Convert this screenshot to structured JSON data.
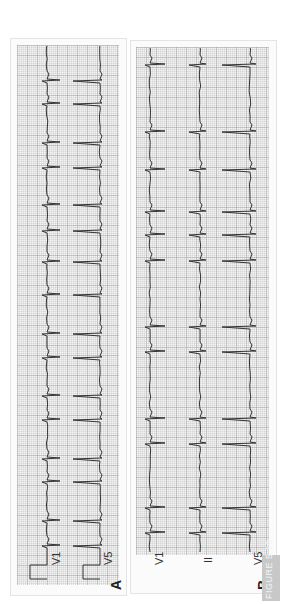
{
  "figure_label": "FIGURE 5.10",
  "panels": [
    {
      "letter": "A",
      "leads": [
        "V1",
        "V5"
      ]
    },
    {
      "letter": "B",
      "leads": [
        "V1",
        "II",
        "V5"
      ]
    }
  ],
  "colors": {
    "trace": "#333333",
    "grid_major": "#b0b0b0",
    "grid_minor": "#d8d8d8",
    "paper": "#f4f4f4",
    "label_box": "#c8c8c8"
  },
  "chart_data": [
    {
      "type": "line",
      "title": "A",
      "orientation": "rotated 90° counter-clockwise (time runs bottom→top)",
      "series": [
        {
          "name": "V1",
          "beat_positions_px": [
            80,
            103,
            142,
            167,
            204,
            230,
            261,
            294,
            333,
            357,
            395,
            419,
            458,
            481,
            520,
            545
          ]
        },
        {
          "name": "V5",
          "beat_positions_px": [
            80,
            103,
            142,
            167,
            204,
            230,
            261,
            294,
            333,
            357,
            395,
            419,
            458,
            481,
            520,
            545
          ]
        }
      ],
      "annotations": [
        "calibration pulse at start of each lead"
      ],
      "grid": true
    },
    {
      "type": "line",
      "title": "B",
      "orientation": "rotated 90° counter-clockwise (time runs bottom→top)",
      "series": [
        {
          "name": "V1",
          "beat_positions_px": [
            64,
            131,
            169,
            211,
            234,
            260,
            326,
            351,
            418,
            443,
            507,
            532
          ]
        },
        {
          "name": "II",
          "beat_positions_px": [
            64,
            131,
            169,
            211,
            234,
            260,
            326,
            351,
            418,
            443,
            507,
            532
          ]
        },
        {
          "name": "V5",
          "beat_positions_px": [
            64,
            131,
            169,
            211,
            234,
            260,
            326,
            351,
            418,
            443,
            507,
            532
          ]
        }
      ],
      "grid": true
    }
  ]
}
